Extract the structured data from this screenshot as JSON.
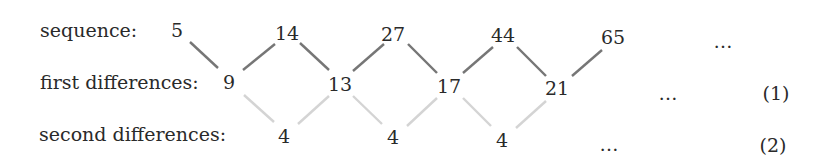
{
  "labels": {
    "sequence": "sequence:",
    "first": "first differences:",
    "second": "second differences:"
  },
  "sequence": [
    "5",
    "14",
    "27",
    "44",
    "65",
    "…"
  ],
  "first_differences": [
    "9",
    "13",
    "17",
    "21",
    "…"
  ],
  "second_differences": [
    "4",
    "4",
    "4",
    "…"
  ],
  "equation_numbers": {
    "first": "(1)",
    "second": "(2)"
  },
  "colors": {
    "text": "#2a2a2a",
    "first_links": "#767676",
    "second_links": "#d4d4d4"
  }
}
